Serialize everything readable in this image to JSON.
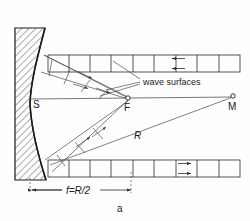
{
  "figure": {
    "panel_label": "a",
    "caption_note": "Concave mirror focusing plane wave surfaces to focal point",
    "colors": {
      "ink": "#1c1c1c",
      "ray": "#4a4a4a",
      "grid": "#2b2b2b",
      "background": "#fefefe"
    }
  },
  "labels": {
    "vertex": "S",
    "focus": "F",
    "center_of_curvature": "M",
    "radius": "R",
    "wave_surfaces": "wave surfaces",
    "focal_length": "f=R/2"
  },
  "points": {
    "vertex": {
      "name": "S",
      "x": 30,
      "y": 103
    },
    "focus": {
      "name": "F",
      "x": 128,
      "y": 98
    },
    "center": {
      "name": "M",
      "x": 233,
      "y": 96
    }
  },
  "geometry": {
    "optical_axis_y": 99,
    "mirror_vertex_x": 30,
    "focal_length_px": 98,
    "radius_px": 203
  },
  "wave_grid_top": {
    "y_top": 55,
    "y_bottom": 72,
    "x_start": 48,
    "x_end": 240,
    "cell_count": 9,
    "arrow_direction": "left",
    "arrow_cell_index": 5
  },
  "wave_grid_bottom": {
    "y_top": 160,
    "y_bottom": 177,
    "x_start": 48,
    "x_end": 240,
    "cell_count": 9,
    "arrow_direction": "right",
    "arrow_cell_index": 6
  },
  "dimension": {
    "text": "f=R/2",
    "y": 191,
    "x_start": 30,
    "x_end": 131,
    "arrow_heads": "both"
  },
  "annotations": {
    "wave_surfaces_leader_count": 3
  }
}
